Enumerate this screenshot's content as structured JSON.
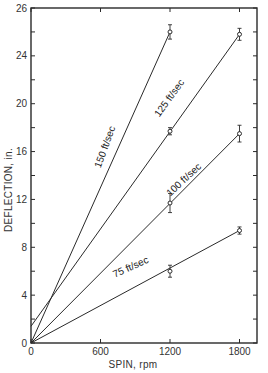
{
  "chart_data": {
    "type": "line",
    "title": "",
    "xlabel": "SPIN, rpm",
    "ylabel": "DEFLECTION, in.",
    "xlim": [
      0,
      1950
    ],
    "ylim": [
      0,
      28
    ],
    "grid": false,
    "legend": "inline labels along lines",
    "x_ticks": [
      0,
      600,
      1200,
      1800
    ],
    "x_tick_labels": [
      "0",
      "600",
      "1200",
      "1800"
    ],
    "y_ticks": [
      0,
      2,
      4,
      6,
      8,
      10,
      12,
      14,
      16,
      18,
      20,
      22,
      24,
      26,
      28
    ],
    "y_tick_labels": [
      {
        "value": 0,
        "label": "0"
      },
      {
        "value": 4,
        "label": "4"
      },
      {
        "value": 8,
        "label": "8"
      },
      {
        "value": 12,
        "label": "12"
      },
      {
        "value": 16,
        "label": "16"
      },
      {
        "value": 20,
        "label": "20"
      },
      {
        "value": 24,
        "label": "24"
      },
      {
        "value": 28,
        "label": "26"
      }
    ],
    "series": [
      {
        "name": "150 ft/sec",
        "label": "150 ft/sec",
        "line": {
          "x0": 0,
          "y0": 0,
          "x1": 1200,
          "y1": 26.0
        },
        "points": [
          {
            "x": 1200,
            "y": 26.0,
            "err": 0.6
          }
        ]
      },
      {
        "name": "125 ft/sec",
        "label": "125 ft/sec",
        "line": {
          "x0": 0,
          "y0": 1.4,
          "x1": 1800,
          "y1": 25.8
        },
        "points": [
          {
            "x": 1200,
            "y": 17.7,
            "err": 0.3
          },
          {
            "x": 1800,
            "y": 25.8,
            "err": 0.5
          }
        ]
      },
      {
        "name": "100 ft/sec",
        "label": "100 ft/sec",
        "line": {
          "x0": 0,
          "y0": 0,
          "x1": 1800,
          "y1": 17.5
        },
        "points": [
          {
            "x": 1200,
            "y": 11.7,
            "err": 0.8
          },
          {
            "x": 1800,
            "y": 17.5,
            "err": 0.7
          }
        ]
      },
      {
        "name": "75 ft/sec",
        "label": "75 ft/sec",
        "line": {
          "x0": 0,
          "y0": 0,
          "x1": 1800,
          "y1": 9.4
        },
        "points": [
          {
            "x": 1200,
            "y": 6.0,
            "err": 0.5
          },
          {
            "x": 1800,
            "y": 9.4,
            "err": 0.3
          }
        ]
      }
    ]
  }
}
